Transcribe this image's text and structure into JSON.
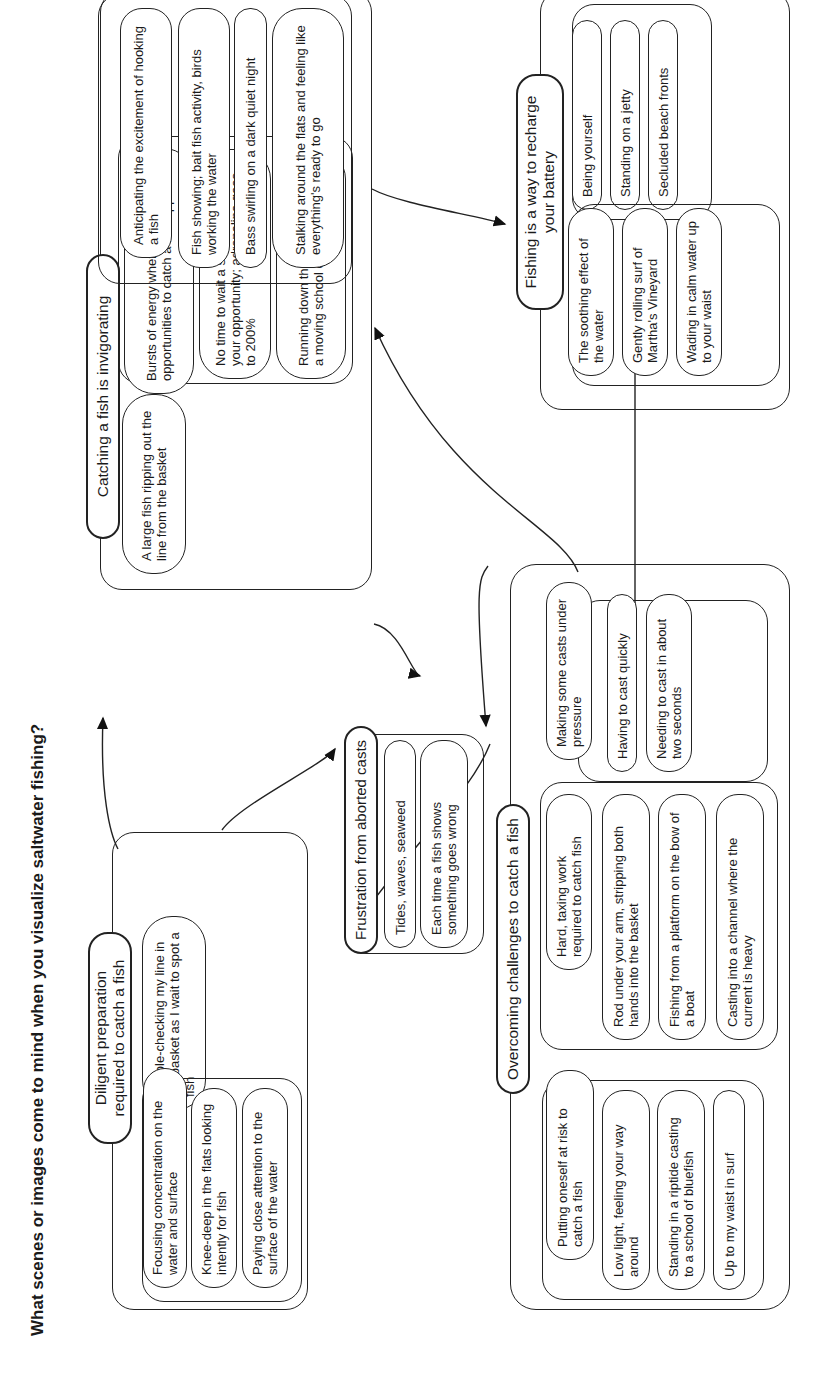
{
  "title": "What scenes or images come to mind when you visualize saltwater fishing?",
  "nodes": {
    "catching": {
      "label": "Catching a fish is invigorating",
      "single": "A large fish ripping out the line from the basket",
      "group1": [
        "Bursts of energy when real opportunities to catch a fish appear",
        "No time to wait a second; you miss your opportunity; adrenaline goes to 200%",
        "Running down the beach to chase a moving school of fish"
      ],
      "group2": [
        "Anticipating the excitement of hooking a fish",
        "Fish showing; bait fish activity, birds working the water",
        "Bass swirling on a dark quiet night",
        "Stalking around the flats and feeling like everything's ready to go"
      ]
    },
    "diligent": {
      "label": "Diligent preparation required to catch a fish",
      "single": "Double-checking my line in the basket as I wait to spot a fish",
      "group": [
        "Focusing concentration on the water and surface",
        "Knee-deep in the flats looking intently for fish",
        "Paying close attention to the surface of the water"
      ]
    },
    "frustration": {
      "label": "Frustration from aborted casts",
      "items": [
        "Tides, waves, seaweed",
        "Each time a fish shows something goes wrong"
      ]
    },
    "overcoming": {
      "label": "Overcoming challenges to catch a fish",
      "group1": [
        "Putting oneself at risk to catch a fish",
        "Low light, feeling your way around",
        "Standing in a riptide casting to a school of bluefish",
        "Up to my waist in surf"
      ],
      "group2": [
        "Hard, taxing work required to catch fish",
        "Rod under your arm, stripping both hands into the basket",
        "Fishing from a platform on the bow of a boat",
        "Casting into a channel where the current is heavy"
      ],
      "group3": [
        "Making some casts under pressure",
        "Having to cast quickly",
        "Needing to cast in about two seconds"
      ]
    },
    "recharge": {
      "label": "Fishing is a way to recharge your battery",
      "group1": [
        "Being yourself",
        "Standing on a jetty",
        "Secluded beach fronts"
      ],
      "group2": [
        "The soothing effect of the water",
        "Gently rolling surf of Martha's Vineyard",
        "Wading in calm water up to your waist"
      ]
    }
  },
  "edges": [
    {
      "from": "diligent",
      "to": "catching"
    },
    {
      "from": "diligent",
      "to": "frustration"
    },
    {
      "from": "catching",
      "to": "frustration"
    },
    {
      "from": "overcoming",
      "to": "frustration"
    },
    {
      "from": "overcoming",
      "to": "diligent"
    },
    {
      "from": "overcoming",
      "to": "catching"
    },
    {
      "from": "overcoming",
      "to": "recharge"
    },
    {
      "from": "catching",
      "to": "recharge"
    }
  ]
}
